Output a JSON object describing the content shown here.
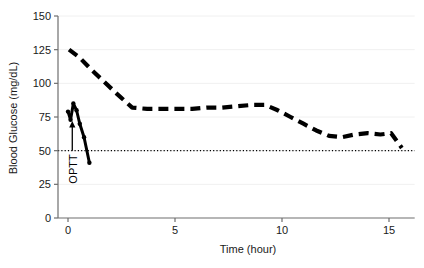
{
  "chart_data": {
    "type": "line",
    "title": "",
    "xlabel": "Time (hour)",
    "ylabel": "Blood Glucose (mg/dL)",
    "xlim": [
      -0.45,
      16.2
    ],
    "ylim": [
      0,
      150
    ],
    "xticks": [
      0,
      5,
      10,
      15
    ],
    "xticklabels": [
      "0",
      "5",
      "10",
      "15"
    ],
    "yticks": [
      0,
      25,
      50,
      75,
      100,
      125,
      150
    ],
    "yticklabels": [
      "0",
      "25",
      "50",
      "75",
      "100",
      "125",
      "150"
    ],
    "grid": "faint-horizontal",
    "legend": "none",
    "line_color": "#000000",
    "series": [
      {
        "name": "Blood glucose (long trend)",
        "style": "dashed",
        "x": [
          0.05,
          0.55,
          1.1,
          1.7,
          2.3,
          3.0,
          3.7,
          4.4,
          5.1,
          5.8,
          6.5,
          7.2,
          7.9,
          8.6,
          9.2,
          9.8,
          10.4,
          11.0,
          11.6,
          12.2,
          12.8,
          13.4,
          14.0,
          14.6,
          15.1,
          15.6
        ],
        "y": [
          125,
          119,
          110,
          101,
          92,
          82,
          81,
          81,
          81,
          81,
          82,
          82,
          83,
          84,
          84,
          80,
          75,
          70,
          65,
          61,
          60,
          62,
          63,
          62,
          63,
          52
        ]
      },
      {
        "name": "OPTT response",
        "style": "solid",
        "x": [
          0.0,
          0.12,
          0.25,
          0.4,
          0.55,
          0.75,
          1.0
        ],
        "y": [
          79,
          73,
          85,
          80,
          70,
          60,
          41
        ]
      }
    ],
    "reference_lines": [
      {
        "name": "hypoglycemia-threshold",
        "axis": "y",
        "value": 50,
        "style": "dotted"
      }
    ],
    "annotations": [
      {
        "name": "OPTT",
        "text": "OPTT",
        "x": 0.2,
        "y_tail": 50,
        "y_head": 72,
        "rotation": -90
      }
    ]
  }
}
